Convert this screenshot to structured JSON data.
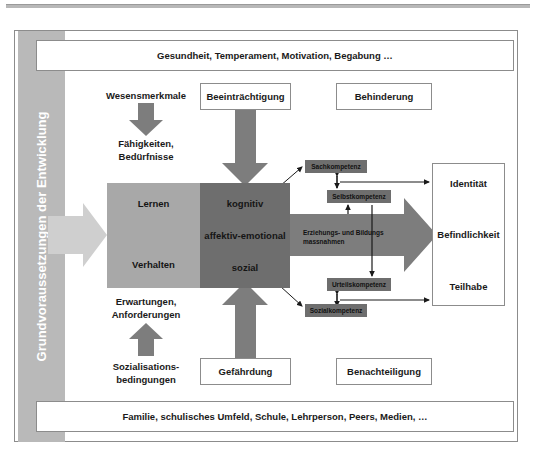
{
  "diagram": {
    "side_band_label": "Grundvoraussetzungen der Entwicklung",
    "top_box": "Gesundheit, Temperament, Motivation, Begabung …",
    "bottom_box": "Familie, schulisches Umfeld, Schule, Lehrperson, Peers, Medien, …",
    "boxes": {
      "beeintraechtigung": "Beeinträchtigung",
      "behinderung": "Behinderung",
      "gefaehrdung": "Gefährdung",
      "benachteiligung": "Benachteiligung"
    },
    "captions": {
      "wesensmerkmale": "Wesensmerkmale",
      "faehigkeiten": "Fähigkeiten,\nBedürfnisse",
      "erwartungen": "Erwartungen,\nAnforderungen",
      "sozialisationsbedingungen": "Sozialisations-\nbedingungen"
    },
    "core": {
      "left_top": "Lernen",
      "left_bottom": "Verhalten",
      "right_1": "kognitiv",
      "right_2": "affektiv-emotional",
      "right_3": "sozial"
    },
    "measures_band": "Erziehungs- und Bildungs\nmassnahmen",
    "competences": {
      "sachkompetenz": "Sachkompetenz",
      "selbstkompetenz": "Selbstkompetenz",
      "urteilskompetenz": "Urteilskompetenz",
      "sozialkompetenz": "Sozialkompetenz"
    },
    "outcomes": {
      "identitaet": "Identität",
      "befindlichkeit": "Befindlichkeit",
      "teilhabe": "Teilhabe"
    },
    "colors": {
      "band_gray": "#b9b9b9",
      "core_light_gray": "#a8a8a8",
      "core_dark_gray": "#6e6e6e",
      "frame_gray": "#8c8c8c",
      "text_black": "#1a1a1a"
    }
  }
}
